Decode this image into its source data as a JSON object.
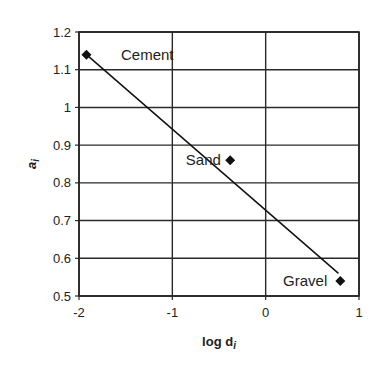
{
  "chart_data": {
    "type": "scatter",
    "title": "",
    "xlabel": "log d",
    "xlabel_sub": "i",
    "ylabel": "a",
    "ylabel_sub": "i",
    "xlim": [
      -2,
      1
    ],
    "ylim": [
      0.5,
      1.2
    ],
    "xticks": [
      -2,
      -1,
      0,
      1
    ],
    "xtick_labels": [
      "-2",
      "-1",
      "0",
      "1"
    ],
    "yticks": [
      0.5,
      0.6,
      0.7,
      0.8,
      0.9,
      1.0,
      1.1,
      1.2
    ],
    "ytick_labels": [
      "0.5",
      "0.6",
      "0.7",
      "0.8",
      "0.9",
      "1",
      "1.1",
      "1.2"
    ],
    "grid": true,
    "legend": null,
    "series": [
      {
        "name": "Materials",
        "marker": "diamond",
        "color": "#111111",
        "points": [
          {
            "label": "Cement",
            "x": -1.92,
            "y": 1.14
          },
          {
            "label": "Sand",
            "x": -0.38,
            "y": 0.86
          },
          {
            "label": "Gravel",
            "x": 0.8,
            "y": 0.54
          }
        ]
      }
    ],
    "trendline": {
      "type": "linear",
      "color": "#111111",
      "x": [
        -1.92,
        0.78
      ],
      "y": [
        1.14,
        0.56
      ]
    },
    "annotations": [
      {
        "text": "Cement",
        "x": -1.55,
        "y": 1.14,
        "anchor": "start"
      },
      {
        "text": "Sand",
        "x": -0.48,
        "y": 0.86,
        "anchor": "end"
      },
      {
        "text": "Gravel",
        "x": 0.66,
        "y": 0.54,
        "anchor": "end"
      }
    ]
  }
}
